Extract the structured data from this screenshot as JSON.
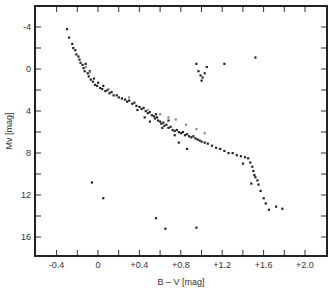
{
  "chart_data": {
    "type": "scatter",
    "title": "",
    "xlabel": "B – V [mag]",
    "ylabel": "Mv [mag]",
    "xlim": [
      -0.61,
      2.22
    ],
    "ylim": [
      17.7,
      -6.1
    ],
    "y_inverted": true,
    "grid": false,
    "legend": null,
    "x_ticks": [
      -0.4,
      0,
      0.4,
      0.8,
      1.2,
      1.6,
      2.0
    ],
    "x_tick_labels": [
      "-0.4",
      "0",
      "+0.4",
      "+0.8",
      "+1.2",
      "+1.6",
      "+2.0"
    ],
    "x_minor_ticks": [
      -0.4,
      -0.2,
      0,
      0.2,
      0.4,
      0.6,
      0.8,
      1.0,
      1.2,
      1.4,
      1.6,
      1.8,
      2.0
    ],
    "y_ticks": [
      -4,
      0,
      4,
      8,
      12,
      16
    ],
    "y_tick_labels": [
      "-4",
      "0",
      "4",
      "8",
      "12",
      "16"
    ],
    "y_minor_ticks": [
      -4,
      -2,
      0,
      2,
      4,
      6,
      8,
      10,
      12,
      14,
      16
    ],
    "series": [
      {
        "name": "main sequence",
        "color": "#222222",
        "points": [
          [
            -0.3,
            -3.8
          ],
          [
            -0.28,
            -3.0
          ],
          [
            -0.25,
            -2.4
          ],
          [
            -0.24,
            -2.0
          ],
          [
            -0.22,
            -1.8
          ],
          [
            -0.21,
            -1.4
          ],
          [
            -0.19,
            -1.2
          ],
          [
            -0.18,
            -0.9
          ],
          [
            -0.17,
            -0.6
          ],
          [
            -0.15,
            -0.4
          ],
          [
            -0.14,
            -0.1
          ],
          [
            -0.13,
            0.2
          ],
          [
            -0.12,
            -0.5
          ],
          [
            -0.1,
            0.4
          ],
          [
            -0.09,
            0.7
          ],
          [
            -0.08,
            0.2
          ],
          [
            -0.07,
            1.0
          ],
          [
            -0.05,
            1.2
          ],
          [
            -0.04,
            0.9
          ],
          [
            -0.03,
            1.5
          ],
          [
            -0.01,
            1.6
          ],
          [
            0.0,
            1.3
          ],
          [
            0.02,
            1.8
          ],
          [
            0.04,
            1.9
          ],
          [
            0.05,
            1.6
          ],
          [
            0.07,
            2.1
          ],
          [
            0.09,
            2.0
          ],
          [
            0.11,
            2.3
          ],
          [
            0.13,
            2.2
          ],
          [
            0.15,
            2.5
          ],
          [
            0.18,
            2.5
          ],
          [
            0.2,
            2.7
          ],
          [
            0.23,
            2.8
          ],
          [
            0.26,
            2.9
          ],
          [
            0.28,
            3.1
          ],
          [
            0.3,
            3.0
          ],
          [
            0.33,
            3.3
          ],
          [
            0.35,
            3.2
          ],
          [
            0.37,
            3.5
          ],
          [
            0.4,
            3.6
          ],
          [
            0.42,
            3.8
          ],
          [
            0.44,
            3.7
          ],
          [
            0.46,
            4.0
          ],
          [
            0.48,
            4.2
          ],
          [
            0.5,
            4.1
          ],
          [
            0.52,
            4.4
          ],
          [
            0.54,
            4.5
          ],
          [
            0.55,
            4.7
          ],
          [
            0.57,
            4.6
          ],
          [
            0.58,
            4.9
          ],
          [
            0.6,
            5.0
          ],
          [
            0.61,
            5.2
          ],
          [
            0.63,
            5.1
          ],
          [
            0.64,
            5.4
          ],
          [
            0.66,
            5.3
          ],
          [
            0.68,
            5.6
          ],
          [
            0.7,
            5.5
          ],
          [
            0.72,
            5.8
          ],
          [
            0.74,
            5.9
          ],
          [
            0.76,
            5.8
          ],
          [
            0.78,
            6.0
          ],
          [
            0.8,
            6.1
          ],
          [
            0.82,
            6.0
          ],
          [
            0.84,
            6.3
          ],
          [
            0.86,
            6.2
          ],
          [
            0.88,
            6.4
          ],
          [
            0.9,
            6.5
          ],
          [
            0.92,
            6.4
          ],
          [
            0.94,
            6.6
          ],
          [
            0.96,
            6.7
          ],
          [
            0.98,
            6.8
          ],
          [
            1.0,
            6.9
          ],
          [
            1.03,
            7.0
          ],
          [
            1.06,
            7.1
          ],
          [
            1.1,
            7.3
          ],
          [
            1.14,
            7.5
          ],
          [
            1.18,
            7.6
          ],
          [
            1.22,
            7.8
          ],
          [
            1.26,
            8.0
          ],
          [
            1.3,
            8.0
          ],
          [
            1.34,
            8.2
          ],
          [
            1.38,
            8.3
          ],
          [
            1.42,
            8.4
          ],
          [
            1.45,
            8.5
          ],
          [
            1.47,
            8.9
          ],
          [
            1.49,
            9.3
          ],
          [
            1.5,
            9.7
          ],
          [
            1.51,
            10.1
          ],
          [
            1.52,
            10.3
          ],
          [
            1.54,
            10.6
          ],
          [
            1.55,
            11.0
          ],
          [
            1.57,
            11.6
          ],
          [
            1.6,
            12.3
          ],
          [
            1.62,
            12.8
          ],
          [
            1.65,
            13.4
          ],
          [
            1.72,
            13.1
          ],
          [
            1.78,
            13.3
          ],
          [
            0.5,
            5.0
          ],
          [
            0.56,
            4.3
          ],
          [
            0.62,
            5.6
          ],
          [
            0.68,
            4.9
          ],
          [
            0.74,
            6.3
          ],
          [
            0.45,
            4.6
          ],
          [
            0.38,
            3.9
          ],
          [
            0.78,
            7.0
          ],
          [
            0.86,
            7.6
          ],
          [
            1.4,
            9.0
          ],
          [
            1.48,
            10.9
          ]
        ]
      },
      {
        "name": "subgiants (grey)",
        "color": "#888888",
        "points": [
          [
            -0.12,
            -0.2
          ],
          [
            -0.08,
            0.3
          ],
          [
            0.1,
            1.9
          ],
          [
            0.3,
            2.7
          ],
          [
            0.48,
            3.9
          ],
          [
            0.6,
            4.3
          ],
          [
            0.68,
            4.6
          ],
          [
            0.75,
            4.8
          ],
          [
            0.85,
            5.3
          ],
          [
            0.95,
            5.7
          ],
          [
            1.03,
            6.1
          ]
        ]
      },
      {
        "name": "giants",
        "color": "#222222",
        "points": [
          [
            0.95,
            -0.5
          ],
          [
            0.97,
            0.2
          ],
          [
            0.99,
            0.6
          ],
          [
            1.01,
            0.8
          ],
          [
            1.03,
            0.4
          ],
          [
            1.05,
            -0.2
          ],
          [
            1.0,
            1.1
          ],
          [
            1.22,
            -0.5
          ],
          [
            1.52,
            -1.1
          ]
        ]
      },
      {
        "name": "white dwarfs",
        "color": "#222222",
        "points": [
          [
            -0.06,
            10.8
          ],
          [
            0.05,
            12.3
          ],
          [
            0.56,
            14.2
          ],
          [
            0.65,
            15.2
          ],
          [
            0.95,
            15.1
          ]
        ]
      }
    ]
  },
  "axes": {
    "xlabel": "B – V [mag]",
    "ylabel": "Mv [mag]"
  }
}
